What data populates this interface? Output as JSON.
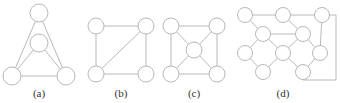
{
  "figure": {
    "panels": [
      {
        "id": "a",
        "label": "(a)",
        "label_pos": [
          39,
          97
        ],
        "radius": 9,
        "nodes": [
          [
            39,
            13
          ],
          [
            39,
            43
          ],
          [
            12,
            76
          ],
          [
            66,
            76
          ]
        ],
        "edges": [
          [
            0,
            2
          ],
          [
            0,
            3
          ],
          [
            1,
            2
          ],
          [
            1,
            3
          ],
          [
            2,
            3
          ]
        ]
      },
      {
        "id": "b",
        "label": "(b)",
        "label_pos": [
          121,
          97
        ],
        "radius": 8,
        "nodes": [
          [
            96,
            26
          ],
          [
            146,
            26
          ],
          [
            96,
            74
          ],
          [
            146,
            74
          ]
        ],
        "edges": [
          [
            0,
            1
          ],
          [
            0,
            2
          ],
          [
            1,
            3
          ],
          [
            2,
            3
          ],
          [
            1,
            2
          ]
        ]
      },
      {
        "id": "c",
        "label": "(c)",
        "label_pos": [
          194,
          97
        ],
        "radius": 8,
        "nodes": [
          [
            171,
            26
          ],
          [
            217,
            26
          ],
          [
            171,
            74
          ],
          [
            217,
            74
          ],
          [
            194,
            50
          ]
        ],
        "edges": [
          [
            0,
            1
          ],
          [
            0,
            2
          ],
          [
            1,
            3
          ],
          [
            2,
            3
          ],
          [
            0,
            4
          ],
          [
            1,
            4
          ],
          [
            2,
            4
          ],
          [
            3,
            4
          ]
        ]
      },
      {
        "id": "d",
        "label": "(d)",
        "label_pos": [
          283,
          97
        ],
        "radius": 7.5,
        "nodes": [
          [
            245,
            15
          ],
          [
            283,
            15
          ],
          [
            322,
            15
          ],
          [
            263,
            34
          ],
          [
            303,
            34
          ],
          [
            245,
            53
          ],
          [
            283,
            53
          ],
          [
            320,
            53
          ],
          [
            263,
            72
          ],
          [
            303,
            72
          ]
        ],
        "edges": [
          [
            0,
            1
          ],
          [
            1,
            2
          ],
          [
            0,
            3
          ],
          [
            1,
            4
          ],
          [
            3,
            4
          ],
          [
            3,
            5
          ],
          [
            3,
            6
          ],
          [
            4,
            6
          ],
          [
            4,
            7
          ],
          [
            5,
            8
          ],
          [
            6,
            8
          ],
          [
            6,
            9
          ],
          [
            7,
            9
          ],
          [
            2,
            7
          ]
        ],
        "polyline_edges": [
          [
            [
              322,
              15
            ],
            [
              336,
              15
            ],
            [
              336,
              80
            ],
            [
              303,
              80
            ]
          ]
        ]
      }
    ],
    "colors": {
      "stroke": "#b8b8b8",
      "node_fill": "#ffffff",
      "label": "#333333"
    }
  }
}
